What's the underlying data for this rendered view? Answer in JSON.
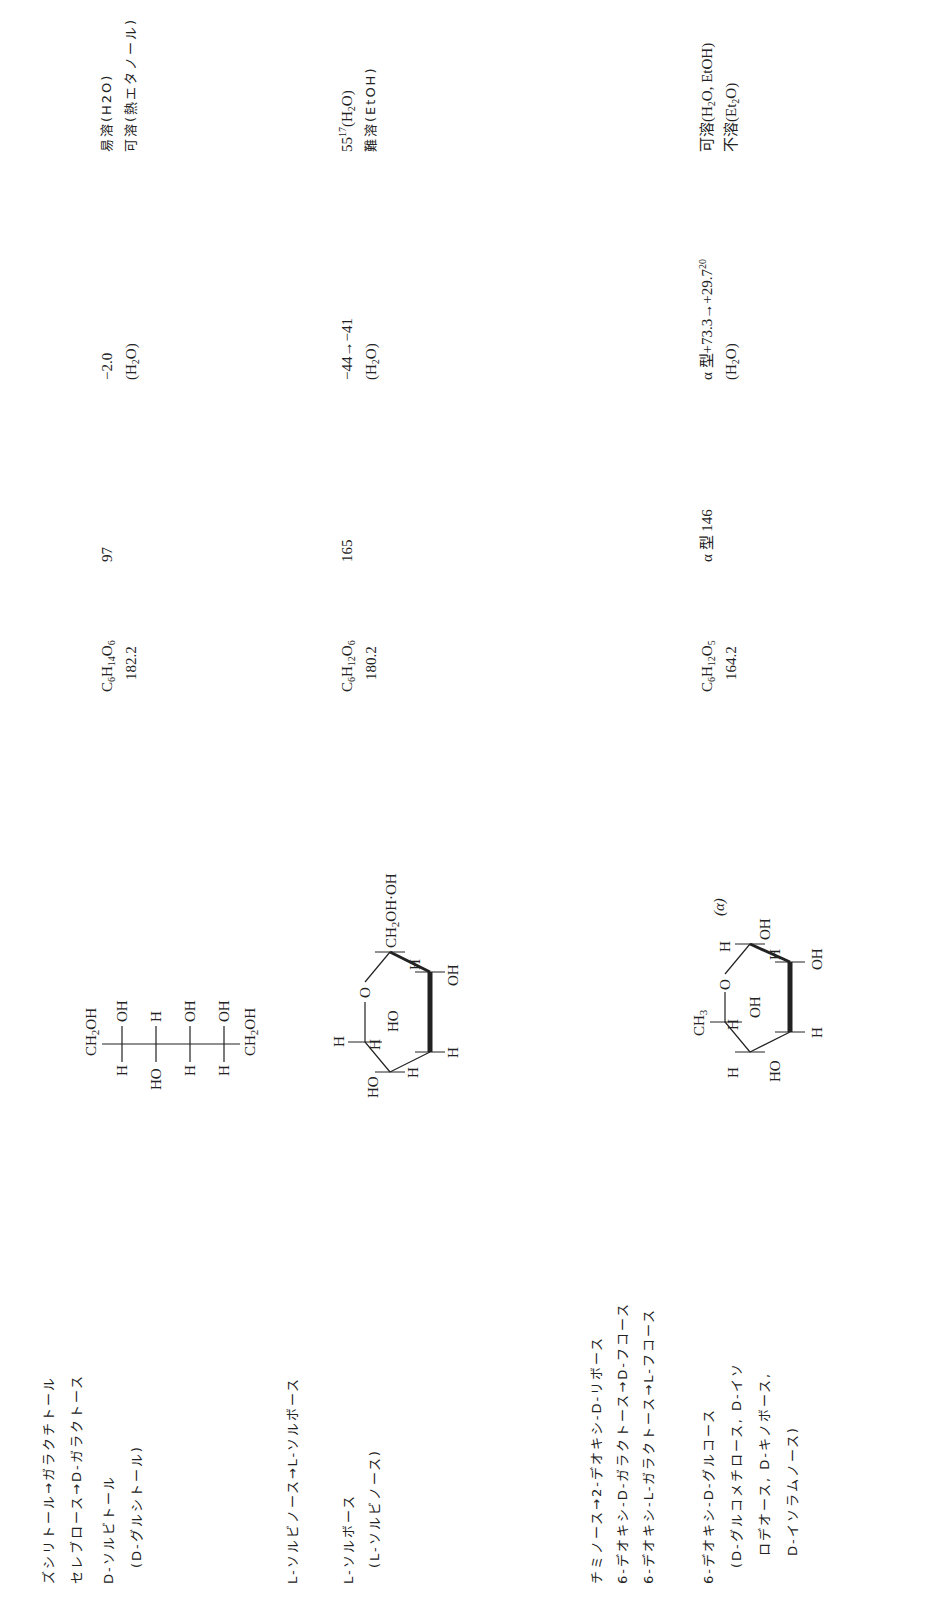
{
  "document": {
    "orientation": "rotated-90-ccw",
    "columns": [
      "name",
      "structure",
      "formula_mw",
      "mp",
      "specific_rotation",
      "solubility"
    ],
    "rows": [
      {
        "id": "row-0",
        "name_lines": [
          "ズシリトール→ガラクチトール",
          "セレブロース→D-ガラクトース"
        ]
      },
      {
        "id": "row-1",
        "name_lines": [
          "D-ソルビトール",
          "(D-グルシトール)"
        ],
        "structure": {
          "type": "fischer",
          "top": "CH2OH",
          "left": [
            "H",
            "HO",
            "H",
            "H"
          ],
          "right": [
            "OH",
            "H",
            "OH",
            "OH"
          ],
          "bottom": "CH2OH"
        },
        "formula": {
          "C": "6",
          "H": "14",
          "O": "6"
        },
        "mw": "182.2",
        "mp": "97",
        "rotation": [
          "−2.0",
          "(H2O)"
        ],
        "solubility": [
          "易溶(H2O)",
          "可溶(熱エタノール)"
        ]
      },
      {
        "id": "row-2",
        "name_lines": [
          "L-ソルビノース→L-ソルボース"
        ]
      },
      {
        "id": "row-3",
        "name_lines": [
          "L-ソルボース",
          "(L-ソルビノース)"
        ],
        "structure": {
          "type": "haworth",
          "labels": [
            "H",
            "HO",
            "H",
            "H",
            "O",
            "HO",
            "CH2OH·OH",
            "OH",
            "H"
          ]
        },
        "formula": {
          "C": "6",
          "H": "12",
          "O": "6"
        },
        "mw": "180.2",
        "mp": "165",
        "rotation": [
          "−44→−41",
          "(H2O)"
        ],
        "solubility_sup": "17",
        "solubility": [
          "55",
          "(H2O)",
          "難溶(EtOH)"
        ]
      },
      {
        "id": "row-4",
        "name_lines": [
          "チミノース→2-デオキシ-D-リボース",
          "6-デオキシ-D-ガラクトース→D-フコース",
          "6-デオキシ-L-ガラクトース→L-フコース"
        ]
      },
      {
        "id": "row-5",
        "name_lines": [
          "6-デオキシ-D-グルコース",
          "(D-グルコメチロース, D-イソ",
          "ロデオース, D-キノボース,",
          "D-イソラムノース)"
        ],
        "structure": {
          "type": "haworth",
          "anomer": "(α)",
          "labels": [
            "CH3",
            "O",
            "H",
            "H",
            "HO",
            "H",
            "OH",
            "H",
            "OH",
            "H",
            "OH"
          ]
        },
        "formula": {
          "C": "6",
          "H": "12",
          "O": "5"
        },
        "mw": "164.2",
        "mp": "α 型 146",
        "rotation_main": "α 型+73.3→+29.7",
        "rotation_sup": "20",
        "rotation_solvent": "(H2O)",
        "solubility": [
          "可溶(H2O, EtOH)",
          "不溶(Et2O)"
        ]
      }
    ]
  }
}
